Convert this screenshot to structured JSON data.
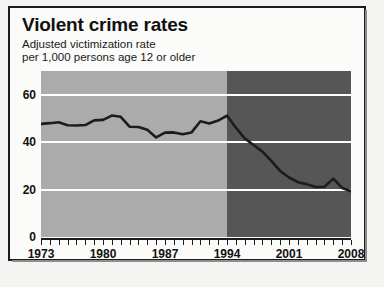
{
  "figure": {
    "title": "Violent crime rates",
    "subtitle_line1": "Adjusted victimization rate",
    "subtitle_line2": "per 1,000 persons age 12 or older"
  },
  "colors": {
    "band_early": "#ababab",
    "band_late": "#565656",
    "gridline": "#ffffff",
    "series_line": "#1c1c1c",
    "axis": "#1c1c1c",
    "text": "#111111",
    "paper": "#fbfbf9"
  },
  "chart_data": {
    "type": "line",
    "title": "Violent crime rates",
    "subtitle": "Adjusted victimization rate per 1,000 persons age 12 or older",
    "xlabel": "",
    "ylabel": "",
    "xlim": [
      1973,
      2008
    ],
    "ylim": [
      0,
      70
    ],
    "yticks": [
      0,
      20,
      40,
      60
    ],
    "ytick_labels": [
      "0",
      "20",
      "40",
      "60"
    ],
    "xticks": [
      1973,
      1980,
      1987,
      1994,
      2001,
      2008
    ],
    "xtick_labels": [
      "1973",
      "1980",
      "1987",
      "1994",
      "2001",
      "2008"
    ],
    "minor_xticks_every": 1,
    "grid": "horizontal-white",
    "legend": "none",
    "shaded_regions": [
      {
        "name": "early-period",
        "x_start": 1973,
        "x_end": 1994,
        "color": "#ababab"
      },
      {
        "name": "late-period",
        "x_start": 1994,
        "x_end": 2008,
        "color": "#565656"
      }
    ],
    "x": [
      1973,
      1974,
      1975,
      1976,
      1977,
      1978,
      1979,
      1980,
      1981,
      1982,
      1983,
      1984,
      1985,
      1986,
      1987,
      1988,
      1989,
      1990,
      1991,
      1992,
      1993,
      1994,
      1995,
      1996,
      1997,
      1998,
      1999,
      2000,
      2001,
      2002,
      2003,
      2004,
      2005,
      2006,
      2007,
      2008
    ],
    "values": [
      47.7,
      48.0,
      48.4,
      47.1,
      47.0,
      47.2,
      49.2,
      49.4,
      51.2,
      50.7,
      46.5,
      46.4,
      45.2,
      42.0,
      44.0,
      44.1,
      43.3,
      44.1,
      48.8,
      47.9,
      49.1,
      51.2,
      46.1,
      41.6,
      38.8,
      36.0,
      32.1,
      27.9,
      25.1,
      23.1,
      22.3,
      21.1,
      21.2,
      24.6,
      20.7,
      19.3
    ]
  },
  "axis_labels": {
    "y": [
      {
        "value": 60,
        "label": "60"
      },
      {
        "value": 40,
        "label": "40"
      },
      {
        "value": 20,
        "label": "20"
      },
      {
        "value": 0,
        "label": "0"
      }
    ],
    "x": [
      {
        "value": 1973,
        "label": "1973"
      },
      {
        "value": 1980,
        "label": "1980"
      },
      {
        "value": 1987,
        "label": "1987"
      },
      {
        "value": 1994,
        "label": "1994"
      },
      {
        "value": 2001,
        "label": "2001"
      },
      {
        "value": 2008,
        "label": "2008"
      }
    ]
  }
}
